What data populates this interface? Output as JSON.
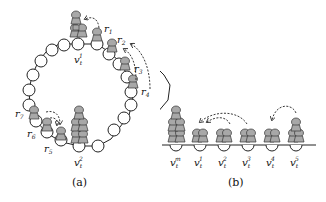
{
  "figure": {
    "panel_a": {
      "caption": "(a)",
      "node_labels": {
        "v1": "v",
        "v1_sub": "t",
        "v1_sup": "1",
        "v2": "v",
        "v2_sub": "t",
        "v2_sup": "2"
      },
      "robot_labels": [
        "r1",
        "r2",
        "r3",
        "r4",
        "r5",
        "r6",
        "r7"
      ],
      "robot_label_parts": [
        {
          "base": "r",
          "sub": "1"
        },
        {
          "base": "r",
          "sub": "2"
        },
        {
          "base": "r",
          "sub": "3"
        },
        {
          "base": "r",
          "sub": "4"
        },
        {
          "base": "r",
          "sub": "5"
        },
        {
          "base": "r",
          "sub": "6"
        },
        {
          "base": "r",
          "sub": "7"
        }
      ]
    },
    "panel_b": {
      "caption": "(b)",
      "node_labels": [
        {
          "base": "v",
          "sub": "t",
          "sup": "m"
        },
        {
          "base": "v",
          "sub": "t",
          "sup": "1"
        },
        {
          "base": "v",
          "sub": "t",
          "sup": "2"
        },
        {
          "base": "v",
          "sub": "t",
          "sup": "3"
        },
        {
          "base": "v",
          "sub": "t",
          "sup": "4"
        },
        {
          "base": "v",
          "sub": "t",
          "sup": "5"
        }
      ]
    },
    "colors": {
      "robot_fill": "#a8a8a8",
      "line": "#222222",
      "node_fill": "#ffffff"
    }
  }
}
